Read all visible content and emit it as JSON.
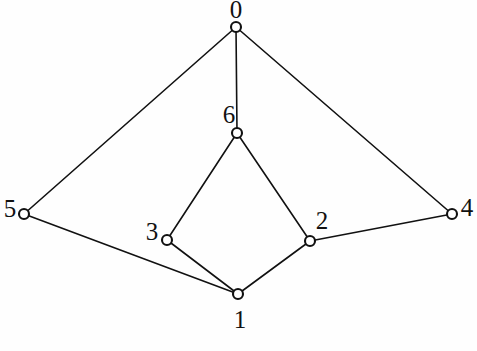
{
  "figure": {
    "kind": "undirected-graph-drawing",
    "background_color": "#fefefe",
    "stroke_color": "#111111",
    "node_fill_color": "#ffffff",
    "width": 477,
    "height": 351,
    "node_radius": 5,
    "label_font_size": 25
  },
  "graph": {
    "node_count": 7,
    "edge_count": 9,
    "nodes": [
      {
        "id": "0",
        "label": "0",
        "x": 236,
        "y": 27,
        "label_x": 236,
        "label_y": 12,
        "degree": 3
      },
      {
        "id": "1",
        "label": "1",
        "x": 238,
        "y": 294,
        "label_x": 240,
        "label_y": 322,
        "degree": 3
      },
      {
        "id": "2",
        "label": "2",
        "x": 310,
        "y": 241,
        "label_x": 322,
        "label_y": 223,
        "degree": 3
      },
      {
        "id": "3",
        "label": "3",
        "x": 167,
        "y": 240,
        "label_x": 152,
        "label_y": 234,
        "degree": 2
      },
      {
        "id": "4",
        "label": "4",
        "x": 452,
        "y": 214,
        "label_x": 467,
        "label_y": 210,
        "degree": 2
      },
      {
        "id": "5",
        "label": "5",
        "x": 24,
        "y": 214,
        "label_x": 10,
        "label_y": 211,
        "degree": 2
      },
      {
        "id": "6",
        "label": "6",
        "x": 237,
        "y": 133,
        "label_x": 229,
        "label_y": 117,
        "degree": 3
      }
    ],
    "edges": [
      {
        "from": "0",
        "to": "5"
      },
      {
        "from": "0",
        "to": "6"
      },
      {
        "from": "0",
        "to": "4"
      },
      {
        "from": "6",
        "to": "3"
      },
      {
        "from": "6",
        "to": "2"
      },
      {
        "from": "5",
        "to": "1"
      },
      {
        "from": "3",
        "to": "1"
      },
      {
        "from": "2",
        "to": "1"
      },
      {
        "from": "2",
        "to": "4"
      }
    ]
  }
}
